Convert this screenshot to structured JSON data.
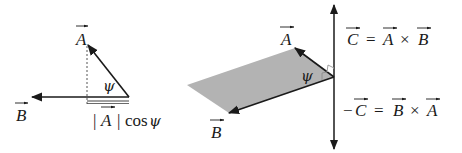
{
  "left_diagram": {
    "vector_a_label": "A",
    "vector_b_label": "B",
    "angle_label": "ψ",
    "projection_label_abs_open": "|",
    "projection_label_vec": "A",
    "projection_label_abs_close": "|",
    "projection_label_func": "cos",
    "projection_label_angle": "ψ"
  },
  "right_diagram": {
    "vector_a_label": "A",
    "vector_b_label": "B",
    "angle_label": "ψ",
    "equation_top": {
      "lhs": "C",
      "eq": "=",
      "op1": "A",
      "times": "×",
      "op2": "B"
    },
    "equation_bottom": {
      "minus": "−",
      "lhs": "C",
      "eq": "=",
      "op1": "B",
      "times": "×",
      "op2": "A"
    }
  },
  "colors": {
    "stroke": "#1a1a1a",
    "plane_fill": "#b3b3b3",
    "background": "#ffffff"
  }
}
